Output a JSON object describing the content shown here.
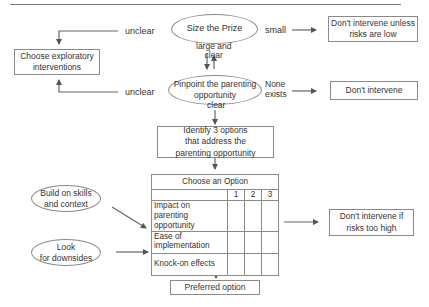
{
  "diagram": {
    "nodes": {
      "size_prize": "Size the Prize",
      "pinpoint": [
        "Pinpoint the parenting",
        "opportunity"
      ],
      "choose_exploratory": [
        "Choose exploratory",
        "interventions"
      ],
      "dont_intervene_unless": [
        "Don't intervene unless",
        "risks are low"
      ],
      "dont_intervene": "Don't intervene",
      "identify_options": [
        "Identify 3 options",
        "that address the",
        "parenting opportunity"
      ],
      "build_skills": [
        "Build on skills",
        "and context"
      ],
      "look_downsides": [
        "Look",
        "for downsides"
      ],
      "dont_intervene_if": [
        "Don't intervene if",
        "risks too high"
      ],
      "preferred_option": "Preferred option"
    },
    "edge_labels": {
      "unclear_top": "unclear",
      "small": "small",
      "large_clear": [
        "large and",
        "clear"
      ],
      "unclear_bottom": "unclear",
      "none_exists": [
        "None",
        "exists"
      ],
      "clear": "clear"
    },
    "option_table": {
      "title": "Choose an Option",
      "columns": [
        "1",
        "2",
        "3"
      ],
      "rows": [
        {
          "criterion": [
            "Impact on parenting",
            "opportunity"
          ]
        },
        {
          "criterion": [
            "Ease of",
            "implementation"
          ]
        },
        {
          "criterion": [
            "Knock-on effects"
          ]
        }
      ]
    }
  }
}
